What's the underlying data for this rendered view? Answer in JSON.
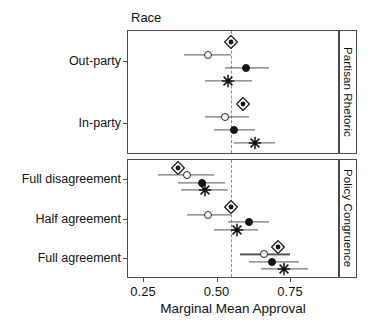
{
  "figure": {
    "facet_title": "Race",
    "x_axis_title": "Marginal Mean Approval",
    "x_ticks": [
      "0.25",
      "0.50",
      "0.75"
    ],
    "strips": [
      "Partisan Rhetoric",
      "Policy Congruence"
    ]
  },
  "chart_data": {
    "type": "scatter",
    "title": "Race",
    "xlabel": "Marginal Mean Approval",
    "ylabel": "",
    "xlim": [
      0.18,
      0.92
    ],
    "xticks": [
      0.25,
      0.5,
      0.75
    ],
    "xticklabels": [
      "0.25",
      "0.50",
      "0.75"
    ],
    "grid": false,
    "legend": "none",
    "reference_line": 0.55,
    "reference_line_style": "dashed",
    "orientation": "horizontal-dotwhisker",
    "marker_types": [
      "diamond",
      "open-circle",
      "filled-circle",
      "star"
    ],
    "panels": [
      {
        "strip_label": "Partisan Rhetoric",
        "groups": [
          {
            "category": "Out-party",
            "points": [
              {
                "marker": "diamond",
                "estimate": 0.55,
                "ci_low": 0.55,
                "ci_high": 0.55
              },
              {
                "marker": "open-circle",
                "estimate": 0.47,
                "ci_low": 0.39,
                "ci_high": 0.55
              },
              {
                "marker": "filled-circle",
                "estimate": 0.6,
                "ci_low": 0.53,
                "ci_high": 0.68
              },
              {
                "marker": "star",
                "estimate": 0.54,
                "ci_low": 0.46,
                "ci_high": 0.62
              }
            ]
          },
          {
            "category": "In-party",
            "points": [
              {
                "marker": "diamond",
                "estimate": 0.59,
                "ci_low": 0.59,
                "ci_high": 0.59
              },
              {
                "marker": "open-circle",
                "estimate": 0.53,
                "ci_low": 0.46,
                "ci_high": 0.61
              },
              {
                "marker": "filled-circle",
                "estimate": 0.56,
                "ci_low": 0.49,
                "ci_high": 0.63
              },
              {
                "marker": "star",
                "estimate": 0.63,
                "ci_low": 0.56,
                "ci_high": 0.7
              }
            ]
          }
        ]
      },
      {
        "strip_label": "Policy Congruence",
        "groups": [
          {
            "category": "Full disagreement",
            "points": [
              {
                "marker": "diamond",
                "estimate": 0.37,
                "ci_low": 0.37,
                "ci_high": 0.37
              },
              {
                "marker": "open-circle",
                "estimate": 0.4,
                "ci_low": 0.3,
                "ci_high": 0.49
              },
              {
                "marker": "filled-circle",
                "estimate": 0.45,
                "ci_low": 0.37,
                "ci_high": 0.53
              },
              {
                "marker": "star",
                "estimate": 0.46,
                "ci_low": 0.38,
                "ci_high": 0.54
              }
            ]
          },
          {
            "category": "Half agreement",
            "points": [
              {
                "marker": "diamond",
                "estimate": 0.55,
                "ci_low": 0.55,
                "ci_high": 0.55
              },
              {
                "marker": "open-circle",
                "estimate": 0.47,
                "ci_low": 0.4,
                "ci_high": 0.55
              },
              {
                "marker": "filled-circle",
                "estimate": 0.61,
                "ci_low": 0.54,
                "ci_high": 0.68
              },
              {
                "marker": "star",
                "estimate": 0.57,
                "ci_low": 0.49,
                "ci_high": 0.64
              }
            ]
          },
          {
            "category": "Full agreement",
            "points": [
              {
                "marker": "diamond",
                "estimate": 0.71,
                "ci_low": 0.71,
                "ci_high": 0.71
              },
              {
                "marker": "open-circle",
                "estimate": 0.66,
                "ci_low": 0.58,
                "ci_high": 0.75
              },
              {
                "marker": "filled-circle",
                "estimate": 0.69,
                "ci_low": 0.61,
                "ci_high": 0.78
              },
              {
                "marker": "star",
                "estimate": 0.73,
                "ci_low": 0.65,
                "ci_high": 0.81
              }
            ]
          }
        ]
      }
    ]
  }
}
